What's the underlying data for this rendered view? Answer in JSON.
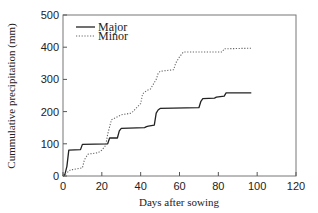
{
  "chart_data": {
    "type": "line",
    "title": "",
    "xlabel": "Days after sowing",
    "ylabel": "Cummulative precipitation (mm)",
    "xlim": [
      0,
      120
    ],
    "ylim": [
      0,
      500
    ],
    "xticks": [
      0,
      20,
      40,
      60,
      80,
      100,
      120
    ],
    "yticks": [
      0,
      100,
      200,
      300,
      400,
      500
    ],
    "grid": false,
    "legend_position": "upper left",
    "series": [
      {
        "name": "Major",
        "style": "solid",
        "color": "#222222",
        "x": [
          0,
          1,
          2,
          3,
          9,
          10,
          23,
          24,
          28,
          29,
          30,
          42,
          43,
          44,
          47,
          48,
          49,
          50,
          70,
          71,
          72,
          78,
          79,
          83,
          84,
          97
        ],
        "y": [
          0,
          5,
          30,
          80,
          82,
          98,
          100,
          118,
          118,
          140,
          148,
          150,
          153,
          155,
          158,
          195,
          205,
          210,
          212,
          232,
          240,
          242,
          245,
          248,
          258,
          258
        ]
      },
      {
        "name": "Minor",
        "style": "dotted",
        "color": "#666666",
        "x": [
          0,
          2,
          4,
          5,
          10,
          11,
          12,
          13,
          18,
          20,
          22,
          23,
          25,
          30,
          35,
          36,
          40,
          41,
          43,
          45,
          47,
          48,
          49,
          50,
          57,
          58,
          60,
          62,
          82,
          83,
          97
        ],
        "y": [
          0,
          10,
          20,
          20,
          25,
          50,
          60,
          68,
          72,
          80,
          95,
          130,
          175,
          190,
          195,
          200,
          225,
          255,
          265,
          270,
          290,
          300,
          318,
          325,
          330,
          350,
          370,
          385,
          385,
          395,
          397
        ]
      }
    ]
  }
}
